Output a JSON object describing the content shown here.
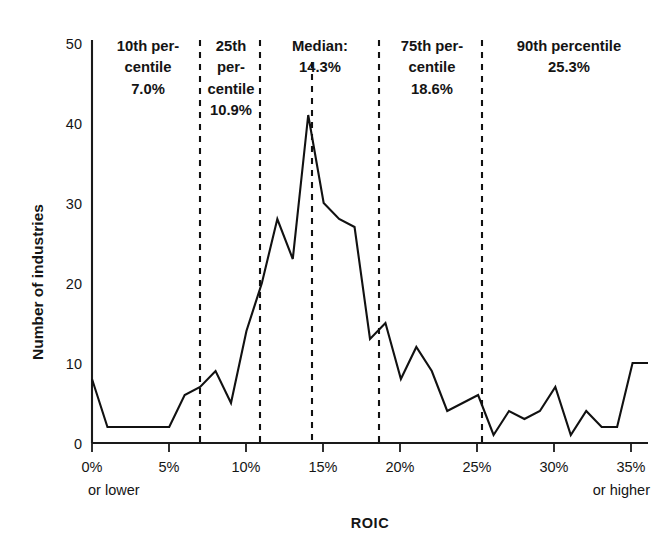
{
  "chart_data": {
    "type": "line",
    "title": "",
    "xlabel": "ROIC",
    "ylabel": "Number of industries",
    "xlim": [
      0,
      36
    ],
    "ylim": [
      0,
      50
    ],
    "grid": false,
    "legend": "none",
    "x_tick_labels": [
      "0%",
      "5%",
      "10%",
      "15%",
      "20%",
      "25%",
      "30%",
      "35%"
    ],
    "x_tick_values": [
      0,
      5,
      10,
      15,
      20,
      25,
      30,
      35
    ],
    "x_axis_end_notes": {
      "left": "or lower",
      "right": "or higher"
    },
    "y_tick_labels": [
      "0",
      "10",
      "20",
      "30",
      "40",
      "50"
    ],
    "y_tick_values": [
      0,
      10,
      20,
      30,
      40,
      50
    ],
    "x": [
      0,
      1,
      2,
      3,
      4,
      5,
      6,
      7,
      8,
      9,
      10,
      11,
      12,
      13,
      14,
      15,
      16,
      17,
      18,
      19,
      20,
      21,
      22,
      23,
      24,
      25,
      26,
      27,
      28,
      29,
      30,
      31,
      32,
      33,
      34,
      35,
      36
    ],
    "values": [
      8,
      2,
      2,
      2,
      2,
      2,
      6,
      7,
      9,
      5,
      14,
      20,
      28,
      23,
      41,
      30,
      28,
      27,
      13,
      15,
      8,
      12,
      9,
      4,
      5,
      6,
      1,
      4,
      3,
      4,
      7,
      1,
      4,
      2,
      2,
      10,
      10
    ],
    "annotations": [
      {
        "name": "p10",
        "label_lines": [
          "10th per-",
          "centile",
          "7.0%"
        ],
        "value": 7.0,
        "x": 7.0
      },
      {
        "name": "p25",
        "label_lines": [
          "25th",
          "per-",
          "centile",
          "10.9%"
        ],
        "value": 10.9,
        "x": 10.9
      },
      {
        "name": "median",
        "label_lines": [
          "Median:",
          "14.3%"
        ],
        "value": 14.3,
        "x": 14.3
      },
      {
        "name": "p75",
        "label_lines": [
          "75th per-",
          "centile",
          "18.6%"
        ],
        "value": 18.6,
        "x": 18.6
      },
      {
        "name": "p90",
        "label_lines": [
          "90th percentile",
          "25.3%"
        ],
        "value": 25.3,
        "x": 25.3
      }
    ]
  },
  "axes": {
    "y_title": "Number of industries",
    "x_title": "ROIC",
    "y_ticks": [
      "50",
      "40",
      "30",
      "20",
      "10",
      "0"
    ],
    "x_ticks": [
      "0%",
      "5%",
      "10%",
      "15%",
      "20%",
      "25%",
      "30%",
      "35%"
    ],
    "x_note_left": "or lower",
    "x_note_right": "or higher"
  },
  "annotations": {
    "p10": {
      "l1": "10th per-",
      "l2": "centile",
      "l3": "7.0%"
    },
    "p25": {
      "l1": "25th",
      "l2": "per-",
      "l3": "centile",
      "l4": "10.9%"
    },
    "median": {
      "l1": "Median:",
      "l2": "14.3%"
    },
    "p75": {
      "l1": "75th per-",
      "l2": "centile",
      "l3": "18.6%"
    },
    "p90": {
      "l1": "90th percentile",
      "l2": "25.3%"
    }
  },
  "colors": {
    "line": "#111111",
    "axis": "#1a1a1a",
    "text": "#151515",
    "background": "#ffffff"
  }
}
